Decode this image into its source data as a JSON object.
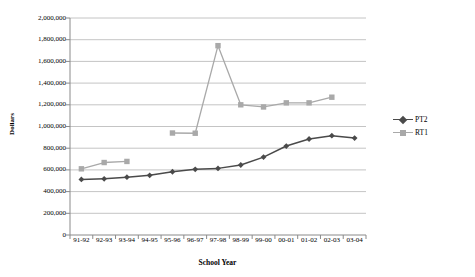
{
  "chart_data": {
    "type": "line",
    "title": "",
    "xlabel": "School Year",
    "ylabel": "Dollars",
    "categories": [
      "91-92",
      "92-93",
      "93-94",
      "94-95",
      "95-96",
      "96-97",
      "97-98",
      "98-99",
      "99-00",
      "00-01",
      "01-02",
      "02-03",
      "03-04"
    ],
    "ylim": [
      0,
      2000000
    ],
    "yticks": [
      0,
      200000,
      400000,
      600000,
      800000,
      1000000,
      1200000,
      1400000,
      1600000,
      1800000,
      2000000
    ],
    "ytick_labels": [
      "0",
      "200,000",
      "400,000",
      "600,000",
      "800,000",
      "1,000,000",
      "1,200,000",
      "1,400,000",
      "1,600,000",
      "1,800,000",
      "2,000,000"
    ],
    "grid": true,
    "legend_position": "right",
    "series": [
      {
        "name": "PT2",
        "color": "#4a4a4a",
        "marker": "diamond",
        "values": [
          512000,
          518000,
          533000,
          550000,
          583000,
          605000,
          614000,
          645000,
          718000,
          820000,
          885000,
          915000,
          893000
        ]
      },
      {
        "name": "RT1",
        "color": "#a9a9a9",
        "marker": "square",
        "values": [
          610000,
          668000,
          678000,
          null,
          940000,
          938000,
          1745000,
          1200000,
          1180000,
          1218000,
          1218000,
          1270000,
          null
        ]
      }
    ]
  },
  "legend": {
    "entries": [
      {
        "label": "PT2"
      },
      {
        "label": "RT1"
      }
    ]
  },
  "axes": {
    "y_title": "Dollars",
    "x_title": "School Year"
  }
}
